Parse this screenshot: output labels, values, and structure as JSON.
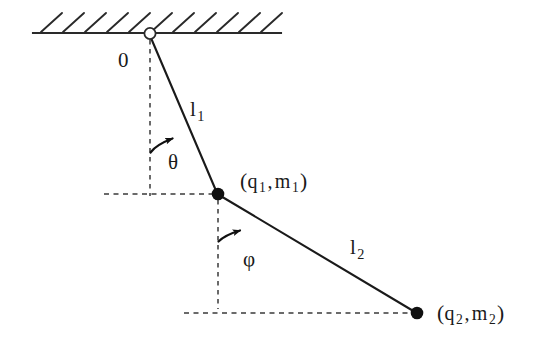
{
  "figure": {
    "background_color": "#ffffff",
    "stroke_color": "#1a1a1a",
    "dash_color": "#3a3a3a"
  },
  "labels": {
    "origin": "0",
    "rod1_length": "l",
    "rod1_length_sub": "1",
    "rod2_length": "l",
    "rod2_length_sub": "2",
    "angle1": "θ",
    "angle2": "φ",
    "mass1_open": "(",
    "mass1_q": "q",
    "mass1_q_sub": "1",
    "mass1_comma": ",",
    "mass1_m": "m",
    "mass1_m_sub": "1",
    "mass1_close": ")",
    "mass2_open": "(",
    "mass2_q": "q",
    "mass2_q_sub": "2",
    "mass2_comma": ",",
    "mass2_m": "m",
    "mass2_m_sub": "2",
    "mass2_close": ")"
  },
  "geometry": {
    "pivot": {
      "x": 150,
      "y": 33
    },
    "mass1": {
      "x": 218,
      "y": 194
    },
    "mass2": {
      "x": 417,
      "y": 313
    },
    "ceiling": {
      "x1": 33,
      "x2": 281,
      "y": 33
    },
    "hatch_count": 11,
    "dashed_vertical_1": {
      "x": 150,
      "y1": 38,
      "y2": 195
    },
    "dashed_vertical_2": {
      "x": 218,
      "y1": 198,
      "y2": 310
    },
    "dashed_horizontal_1": {
      "x1": 105,
      "x2": 216,
      "y": 194
    },
    "dashed_horizontal_2": {
      "x1": 185,
      "x2": 414,
      "y": 313
    }
  },
  "icons": {
    "pivot": "open-circle-hinge",
    "mass": "filled-circle-bob",
    "angle_arrow": "curved-arrow"
  }
}
